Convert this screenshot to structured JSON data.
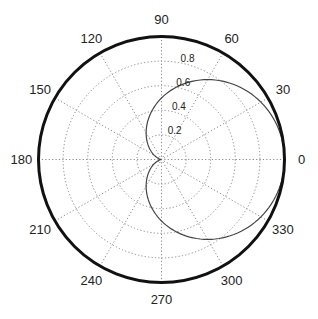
{
  "chart_data": {
    "type": "polar-line",
    "title": "",
    "function": "r = (1 + cos(theta)) / 2",
    "theta_deg": [
      0,
      15,
      30,
      45,
      60,
      75,
      90,
      105,
      120,
      135,
      150,
      165,
      180,
      195,
      210,
      225,
      240,
      255,
      270,
      285,
      300,
      315,
      330,
      345,
      360
    ],
    "r": [
      1.0,
      0.983,
      0.933,
      0.854,
      0.75,
      0.629,
      0.5,
      0.371,
      0.25,
      0.146,
      0.067,
      0.017,
      0.0,
      0.017,
      0.067,
      0.146,
      0.25,
      0.371,
      0.5,
      0.629,
      0.75,
      0.854,
      0.933,
      0.983,
      1.0
    ],
    "rlim": [
      0,
      1
    ],
    "radial_ticks": [
      "0.2",
      "0.4",
      "0.6",
      "0.8"
    ],
    "radial_tick_values": [
      0.2,
      0.4,
      0.6,
      0.8
    ],
    "angle_ticks": [
      "0",
      "30",
      "60",
      "90",
      "120",
      "150",
      "180",
      "210",
      "240",
      "270",
      "300",
      "330"
    ],
    "angle_tick_values": [
      0,
      30,
      60,
      90,
      120,
      150,
      180,
      210,
      240,
      270,
      300,
      330
    ],
    "grid": true,
    "legend": null,
    "colors": {
      "curve": "#444444",
      "frame": "#111111",
      "grid": "#888888"
    }
  }
}
